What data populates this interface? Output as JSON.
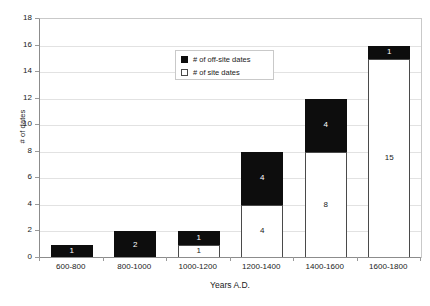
{
  "chart_data": {
    "type": "bar",
    "subtype": "stacked-bar",
    "title": "",
    "xlabel": "Years A.D.",
    "ylabel": "# of dates",
    "categories": [
      "600-800",
      "800-1000",
      "1000-1200",
      "1200-1400",
      "1400-1600",
      "1600-1800"
    ],
    "series": [
      {
        "name": "# of site dates",
        "values": [
          0,
          0,
          1,
          4,
          8,
          15
        ],
        "color": "#ffffff"
      },
      {
        "name": "# of off-site dates",
        "values": [
          1,
          2,
          1,
          4,
          4,
          1
        ],
        "color": "#0d0d0d"
      }
    ],
    "totals": [
      1,
      2,
      2,
      8,
      12,
      16
    ],
    "ylim": [
      0,
      18
    ],
    "yticks": [
      0,
      2,
      4,
      6,
      8,
      10,
      12,
      14,
      16,
      18
    ],
    "grid": true,
    "legend_position": "upper-center"
  },
  "legend": {
    "items": [
      {
        "label": "# of off-site dates",
        "swatch": "filled-square-icon"
      },
      {
        "label": "# of site dates",
        "swatch": "empty-square-icon"
      }
    ]
  },
  "axes": {
    "y_title": "# of dates",
    "x_title": "Years A.D."
  }
}
